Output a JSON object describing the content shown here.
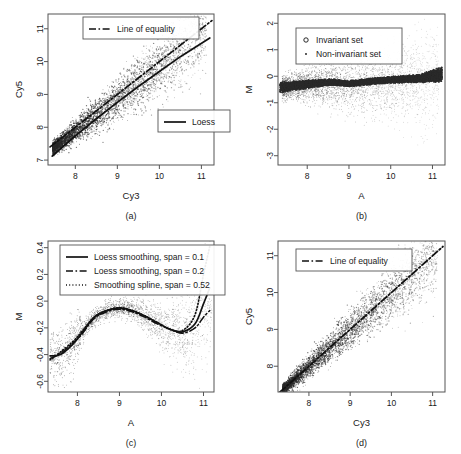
{
  "figure": {
    "panels": [
      {
        "caption": "(a)",
        "xlabel": "Cy3",
        "ylabel": "Cy5",
        "xticks": [
          "8",
          "9",
          "10",
          "11"
        ],
        "yticks": [
          "7",
          "8",
          "9",
          "10",
          "11"
        ],
        "legend": [
          {
            "label": "Line of equality",
            "style": "dashdot"
          },
          {
            "label": "Loess",
            "style": "solid"
          }
        ]
      },
      {
        "caption": "(b)",
        "xlabel": "A",
        "ylabel": "M",
        "xticks": [
          "8",
          "9",
          "10",
          "11"
        ],
        "yticks": [
          "-3",
          "-2",
          "-1",
          "0",
          "1",
          "2"
        ],
        "legend": [
          {
            "label": "Invariant set",
            "style": "circle"
          },
          {
            "label": "Non-invariant set",
            "style": "dot"
          }
        ]
      },
      {
        "caption": "(c)",
        "xlabel": "A",
        "ylabel": "M",
        "xticks": [
          "8",
          "9",
          "10",
          "11"
        ],
        "yticks": [
          "-0.6",
          "-0.4",
          "-0.2",
          "0.0",
          "0.2",
          "0.4"
        ],
        "legend": [
          {
            "label": "Loess smoothing,  span = 0.1",
            "style": "solid"
          },
          {
            "label": "Loess smoothing,  span = 0.2",
            "style": "dashdot"
          },
          {
            "label": "Smoothing spline, span = 0.52",
            "style": "dotted"
          }
        ]
      },
      {
        "caption": "(d)",
        "xlabel": "Cy3",
        "ylabel": "Cy5",
        "xticks": [
          "8",
          "9",
          "10",
          "11"
        ],
        "yticks": [
          "8",
          "9",
          "10",
          "11"
        ],
        "legend": [
          {
            "label": "Line of equality",
            "style": "dashdot"
          }
        ]
      }
    ]
  },
  "chart_data": [
    {
      "type": "scatter",
      "panel": "(a)",
      "title": "",
      "xlabel": "Cy3",
      "ylabel": "Cy5",
      "xlim": [
        7.35,
        11.3
      ],
      "ylim": [
        6.85,
        11.45
      ],
      "xticks": [
        8,
        9,
        10,
        11
      ],
      "yticks": [
        7,
        8,
        9,
        10,
        11
      ],
      "grid": false,
      "legend_position": "top-center and middle-right",
      "series": [
        {
          "name": "Line of equality",
          "type": "line",
          "style": "dashdot",
          "x": [
            7.4,
            11.25
          ],
          "y": [
            7.4,
            11.25
          ]
        },
        {
          "name": "Loess",
          "type": "line",
          "style": "solid",
          "x": [
            7.45,
            8.0,
            8.5,
            9.0,
            9.5,
            10.0,
            10.5,
            11.2
          ],
          "y": [
            7.12,
            7.74,
            8.26,
            8.76,
            9.24,
            9.7,
            10.15,
            10.72
          ]
        },
        {
          "name": "Cy5 vs Cy3 point cloud",
          "type": "points",
          "n_points": 9000,
          "description": "Dense elongated cloud along y=x, widening at higher intensity with a downward-skewed tail"
        }
      ]
    },
    {
      "type": "scatter",
      "panel": "(b)",
      "title": "",
      "xlabel": "A",
      "ylabel": "M",
      "xlim": [
        7.3,
        11.3
      ],
      "ylim": [
        -3.35,
        2.35
      ],
      "xticks": [
        8,
        9,
        10,
        11
      ],
      "yticks": [
        -3,
        -2,
        -1,
        0,
        1,
        2
      ],
      "grid": false,
      "legend_position": "top-left",
      "series": [
        {
          "name": "Non-invariant set",
          "type": "points",
          "marker": "dot",
          "n_points": 7000,
          "description": "Diffuse cloud centered near M = 0 spreading from -2.5 to 1.5"
        },
        {
          "name": "Invariant set",
          "type": "points",
          "marker": "circle",
          "n_points": 4500,
          "description": "Dense dark band just below M = 0, thickening at both ends",
          "band_x": [
            7.35,
            8.0,
            8.6,
            9.0,
            9.6,
            10.2,
            10.7,
            11.15
          ],
          "band_center": [
            -0.42,
            -0.3,
            -0.22,
            -0.28,
            -0.18,
            -0.12,
            -0.08,
            0.05
          ],
          "band_halfwidth": [
            0.22,
            0.16,
            0.13,
            0.12,
            0.13,
            0.14,
            0.16,
            0.3
          ]
        }
      ]
    },
    {
      "type": "line",
      "panel": "(c)",
      "title": "",
      "xlabel": "A",
      "ylabel": "M",
      "xlim": [
        7.3,
        11.25
      ],
      "ylim": [
        -0.68,
        0.45
      ],
      "xticks": [
        8,
        9,
        10,
        11
      ],
      "yticks": [
        -0.6,
        -0.4,
        -0.2,
        0.0,
        0.2,
        0.4
      ],
      "grid": false,
      "legend_position": "top-left",
      "x": [
        7.35,
        7.6,
        7.9,
        8.1,
        8.4,
        8.7,
        9.0,
        9.3,
        9.6,
        9.9,
        10.2,
        10.5,
        10.8,
        11.0,
        11.15
      ],
      "series": [
        {
          "name": "Loess smoothing,  span = 0.1",
          "style": "solid",
          "values": [
            -0.41,
            -0.4,
            -0.32,
            -0.24,
            -0.12,
            -0.07,
            -0.05,
            -0.07,
            -0.11,
            -0.16,
            -0.21,
            -0.23,
            -0.17,
            -0.02,
            0.1
          ]
        },
        {
          "name": "Loess smoothing,  span = 0.2",
          "style": "dashdot",
          "values": [
            -0.43,
            -0.39,
            -0.31,
            -0.25,
            -0.13,
            -0.08,
            -0.06,
            -0.08,
            -0.12,
            -0.17,
            -0.21,
            -0.24,
            -0.2,
            -0.12,
            -0.07
          ]
        },
        {
          "name": "Smoothing spline, span = 0.52",
          "style": "dotted",
          "values": [
            -0.44,
            -0.38,
            -0.3,
            -0.23,
            -0.12,
            -0.07,
            -0.05,
            -0.07,
            -0.11,
            -0.16,
            -0.21,
            -0.22,
            -0.1,
            0.2,
            0.41
          ]
        },
        {
          "name": "M vs A point cloud",
          "type": "points",
          "n_points": 2200,
          "description": "Scattered light points following the smoothing curves, spreading wider above A = 10"
        }
      ]
    },
    {
      "type": "scatter",
      "panel": "(d)",
      "title": "",
      "xlabel": "Cy3",
      "ylabel": "Cy5",
      "xlim": [
        7.25,
        11.3
      ],
      "ylim": [
        7.3,
        11.4
      ],
      "xticks": [
        8,
        9,
        10,
        11
      ],
      "yticks": [
        8,
        9,
        10,
        11
      ],
      "grid": false,
      "legend_position": "top-left",
      "series": [
        {
          "name": "Line of equality",
          "type": "line",
          "style": "dashdot",
          "x": [
            7.3,
            11.25
          ],
          "y": [
            7.3,
            11.25
          ]
        },
        {
          "name": "Normalized Cy5 vs Cy3 point cloud",
          "type": "points",
          "n_points": 8000,
          "description": "Cloud tightly centered on y = x after normalization, fanning out at higher intensities"
        }
      ]
    }
  ]
}
